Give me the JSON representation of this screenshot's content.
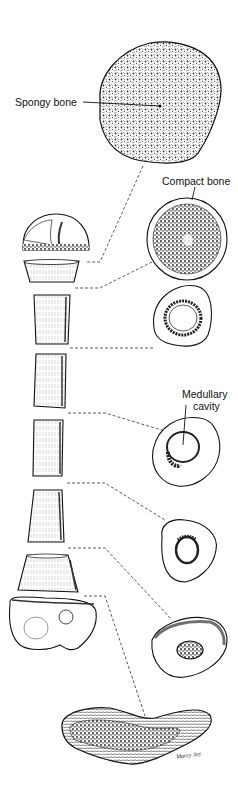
{
  "figure": {
    "labels": {
      "spongy_bone": "Spongy bone",
      "compact_bone": "Compact bone",
      "medullary_cavity_line1": "Medullary",
      "medullary_cavity_line2": "cavity"
    },
    "signature": "Marcy Joy",
    "colors": {
      "ink": "#111111",
      "background": "#ffffff",
      "hatch": "#555555"
    },
    "segments": [
      {
        "name": "proximal-head",
        "type": "epiphysis"
      },
      {
        "name": "neck-slice",
        "type": "metaphysis"
      },
      {
        "name": "shaft-slice-1",
        "type": "diaphysis"
      },
      {
        "name": "shaft-slice-2",
        "type": "diaphysis"
      },
      {
        "name": "shaft-slice-3",
        "type": "diaphysis"
      },
      {
        "name": "shaft-slice-4",
        "type": "diaphysis"
      },
      {
        "name": "distal-slice",
        "type": "metaphysis"
      },
      {
        "name": "distal-condyle",
        "type": "epiphysis"
      }
    ],
    "cross_sections": [
      {
        "name": "cross-section-head",
        "content": "spongy bone"
      },
      {
        "name": "cross-section-neck",
        "content": "spongy bone within compact bone"
      },
      {
        "name": "cross-section-shaft-1",
        "content": "medullary ring"
      },
      {
        "name": "cross-section-shaft-2",
        "content": "medullary cavity"
      },
      {
        "name": "cross-section-shaft-3",
        "content": "small medullary cavity"
      },
      {
        "name": "cross-section-distal",
        "content": "spongy core"
      },
      {
        "name": "cross-section-condyle",
        "content": "spongy bone band"
      }
    ]
  }
}
